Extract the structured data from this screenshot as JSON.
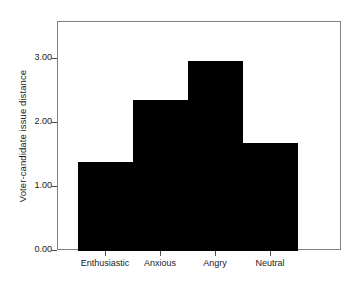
{
  "chart_data": {
    "type": "bar",
    "title": "",
    "subtitle": "",
    "xlabel": "",
    "ylabel": "Voter-candidate issue distance",
    "categories": [
      "Enthusiastic",
      "Anxious",
      "Angry",
      "Neutral"
    ],
    "values": [
      1.41,
      2.38,
      3.0,
      1.7
    ],
    "series": [
      {
        "name": "Voter-candidate issue distance",
        "values": [
          1.41,
          2.38,
          3.0,
          1.7
        ]
      }
    ],
    "ylim": [
      0.0,
      3.58
    ],
    "yticks": [
      0.0,
      1.0,
      2.0,
      3.0
    ],
    "ytick_labels": [
      "0.00",
      "1.00",
      "2.00",
      "3.00"
    ],
    "grid": false,
    "legend": false,
    "legend_position": "none",
    "bar_color": "#000000",
    "background_color": "#ffffff",
    "frame_color": "#808080",
    "annotations": []
  },
  "axes": {
    "y_title": "Voter-candidate issue distance",
    "y_tick_labels": [
      "3.00",
      "2.00",
      "1.00",
      "0.00"
    ],
    "x_tick_labels": [
      "Enthusiastic",
      "Anxious",
      "Angry",
      "Neutral"
    ]
  }
}
